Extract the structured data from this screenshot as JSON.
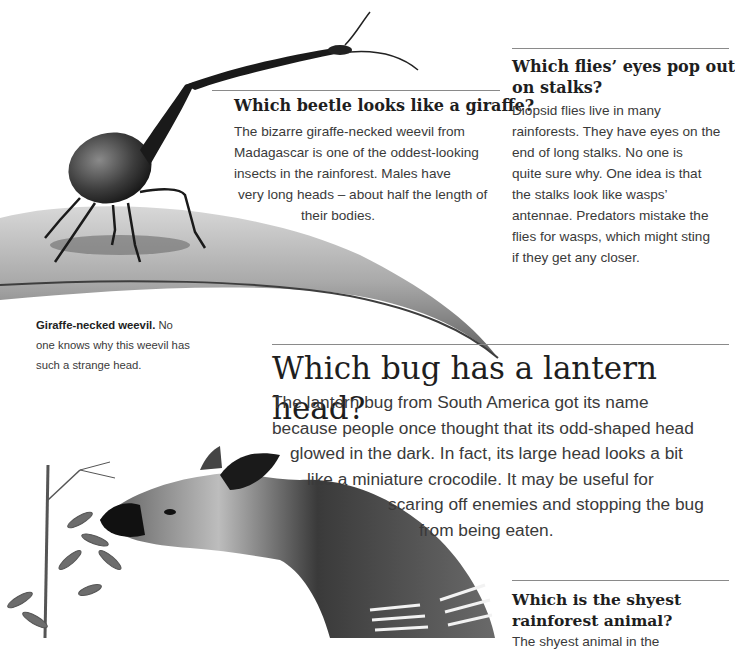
{
  "sections": {
    "beetle": {
      "heading": "Which beetle looks like a giraffe?",
      "lines": [
        "The bizarre giraffe-necked weevil from",
        "Madagascar is one of the oddest-looking",
        "insects in the rainforest. Males have",
        "very long heads – about half the length of",
        "their bodies."
      ]
    },
    "flies": {
      "heading_lines": [
        "Which flies’ eyes pop out",
        "on stalks?"
      ],
      "lines": [
        "Diopsid flies live in many",
        "rainforests. They have eyes on the",
        "end of long stalks. No one is",
        "quite sure why. One idea is that",
        "the stalks look like wasps’",
        "antennae. Predators mistake the",
        "flies for wasps, which might sting",
        "if they get any closer."
      ]
    },
    "caption": {
      "bold": "Giraffe-necked weevil.",
      "first_rest": " No",
      "lines": [
        "one knows why this weevil has",
        "such a strange head."
      ]
    },
    "lantern": {
      "heading": "Which bug has a lantern head?",
      "lines": [
        "The lantern bug from South America got its name",
        "because people once thought that its odd-shaped head",
        "glowed in the dark. In fact, its large head looks a bit",
        "like a miniature crocodile. It may be useful for",
        "scaring off enemies and stopping the bug",
        "from being eaten."
      ]
    },
    "shyest": {
      "heading_lines": [
        "Which is the shyest",
        "rainforest animal?"
      ],
      "lines": [
        "The shyest animal in the"
      ]
    }
  },
  "illustrations": {
    "weevil": "giraffe-necked weevil on a curved leaf",
    "okapi": "okapi eating leaves from a plant"
  }
}
